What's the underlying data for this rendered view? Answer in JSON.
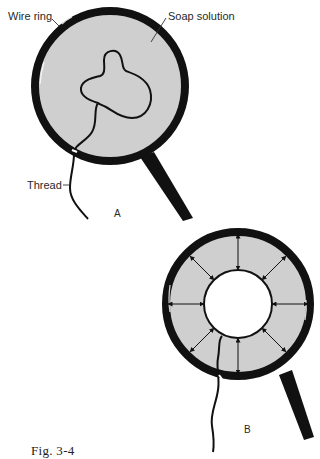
{
  "figure": {
    "caption": "Fig. 3-4",
    "colors": {
      "ring": "#111111",
      "film": "#cfcfcf",
      "thread": "#111111",
      "hole": "#ffffff",
      "background": "#ffffff"
    },
    "panel_a": {
      "label": "A",
      "annotations": {
        "wire_ring": "Wire ring",
        "soap_solution": "Soap solution",
        "thread": "Thread"
      },
      "description": "Wire ring filled with soap film; a loose irregular thread loop floats in the film"
    },
    "panel_b": {
      "label": "B",
      "description": "Film inside the loop broken; surface tension pulls thread into a circle, arrows show radial forces",
      "arrow_count": 8
    }
  }
}
